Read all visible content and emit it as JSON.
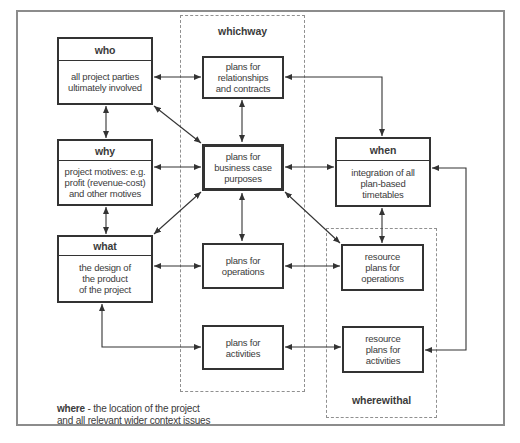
{
  "colors": {
    "background": "#ffffff",
    "frame_border": "#8c8c8c",
    "dashed_border": "#909090",
    "box_border": "#333333",
    "arrow": "#333333",
    "text": "#3b3b3b"
  },
  "diagram": {
    "groups": {
      "whichway": {
        "label": "whichway"
      },
      "wherewithal": {
        "label": "wherewithal"
      }
    },
    "boxes": {
      "who": {
        "title": "who",
        "lines": [
          "all project parties",
          "ultimately involved"
        ]
      },
      "why": {
        "title": "why",
        "lines": [
          "project motives: e.g.",
          "profit (revenue-cost)",
          "and other motives"
        ]
      },
      "what": {
        "title": "what",
        "lines": [
          "the design of",
          "the product",
          "of the project"
        ]
      },
      "when": {
        "title": "when",
        "lines": [
          "integration of all",
          "plan-based",
          "timetables"
        ]
      },
      "relationships": {
        "lines": [
          "plans for",
          "relationships",
          "and contracts"
        ]
      },
      "business_case": {
        "lines": [
          "plans for",
          "business case",
          "purposes"
        ]
      },
      "operations": {
        "lines": [
          "plans for",
          "operations"
        ]
      },
      "activities": {
        "lines": [
          "plans for",
          "activities"
        ]
      },
      "resource_operations": {
        "lines": [
          "resource",
          "plans for",
          "operations"
        ]
      },
      "resource_activities": {
        "lines": [
          "resource",
          "plans for",
          "activities"
        ]
      }
    },
    "caption": {
      "keyword": "where",
      "rest": " - the location of the project",
      "line2": "and all relevant wider context issues"
    }
  }
}
